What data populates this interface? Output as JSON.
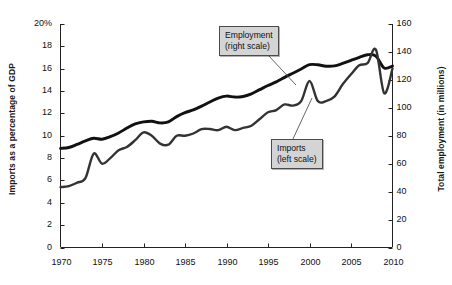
{
  "chart_data": {
    "type": "line",
    "title": "",
    "xlabel": "",
    "ylabel": "Imports as a percentage of GDP",
    "ylabel_right": "Total employment (in millions)",
    "xlim": [
      1970,
      2010
    ],
    "ylim": [
      0,
      20
    ],
    "ylim_right": [
      0,
      160
    ],
    "grid": false,
    "legend_position": "inline-callout",
    "xticks": [
      "1970",
      "1975",
      "1980",
      "1985",
      "1990",
      "1995",
      "2000",
      "2005",
      "2010"
    ],
    "xtick_values": [
      1970,
      1975,
      1980,
      1985,
      1990,
      1995,
      2000,
      2005,
      2010
    ],
    "yticks_left": [
      "0",
      "2",
      "4",
      "6",
      "8",
      "10",
      "12",
      "14",
      "16",
      "18",
      "20%"
    ],
    "ytick_values_left": [
      0,
      2,
      4,
      6,
      8,
      10,
      12,
      14,
      16,
      18,
      20
    ],
    "yticks_right": [
      "0",
      "20",
      "40",
      "60",
      "80",
      "100",
      "120",
      "140",
      "160"
    ],
    "ytick_values_right": [
      0,
      20,
      40,
      60,
      80,
      100,
      120,
      140,
      160
    ],
    "series": [
      {
        "name": "Employment (right scale)",
        "axis": "right",
        "units": "millions",
        "color": "#111111",
        "x": [
          1970,
          1971,
          1972,
          1973,
          1974,
          1975,
          1976,
          1977,
          1978,
          1979,
          1980,
          1981,
          1982,
          1983,
          1984,
          1985,
          1986,
          1987,
          1988,
          1989,
          1990,
          1991,
          1992,
          1993,
          1994,
          1995,
          1996,
          1997,
          1998,
          1999,
          2000,
          2001,
          2002,
          2003,
          2004,
          2005,
          2006,
          2007,
          2008,
          2009,
          2010
        ],
        "values": [
          71.0,
          71.6,
          73.8,
          76.3,
          78.2,
          77.5,
          79.3,
          82.0,
          85.5,
          88.5,
          89.9,
          90.4,
          89.2,
          89.9,
          93.7,
          96.5,
          98.5,
          101.2,
          104.2,
          107.0,
          108.4,
          107.7,
          108.1,
          110.0,
          113.0,
          116.0,
          118.6,
          121.8,
          124.8,
          127.8,
          130.9,
          130.8,
          129.8,
          130.0,
          131.8,
          134.0,
          136.1,
          138.0,
          137.0,
          128.5,
          129.9
        ]
      },
      {
        "name": "Imports (left scale)",
        "axis": "left",
        "units": "percent of GDP",
        "color": "#333333",
        "x": [
          1970,
          1971,
          1972,
          1973,
          1974,
          1975,
          1976,
          1977,
          1978,
          1979,
          1980,
          1981,
          1982,
          1983,
          1984,
          1985,
          1986,
          1987,
          1988,
          1989,
          1990,
          1991,
          1992,
          1993,
          1994,
          1995,
          1996,
          1997,
          1998,
          1999,
          2000,
          2001,
          2002,
          2003,
          2004,
          2005,
          2006,
          2007,
          2008,
          2009,
          2010
        ],
        "values": [
          5.4,
          5.5,
          5.8,
          6.2,
          8.4,
          7.5,
          8.0,
          8.7,
          9.0,
          9.6,
          10.3,
          10.0,
          9.3,
          9.2,
          10.0,
          10.0,
          10.2,
          10.6,
          10.6,
          10.5,
          10.8,
          10.5,
          10.7,
          10.9,
          11.5,
          12.1,
          12.3,
          12.8,
          12.7,
          13.1,
          14.9,
          13.1,
          13.1,
          13.5,
          14.6,
          15.5,
          16.3,
          16.5,
          17.7,
          13.8,
          16.0
        ]
      }
    ],
    "annotations": [
      {
        "id": "employment-callout",
        "lines": [
          "Employment",
          "(right scale)"
        ]
      },
      {
        "id": "imports-callout",
        "lines": [
          "Imports",
          "(left scale)"
        ]
      }
    ]
  },
  "colors": {
    "axis": "#222222",
    "employment_line": "#111111",
    "imports_line": "#333333",
    "callout_bg": "#d4d4d4",
    "callout_border": "#4a4a4a",
    "background": "#ffffff"
  }
}
